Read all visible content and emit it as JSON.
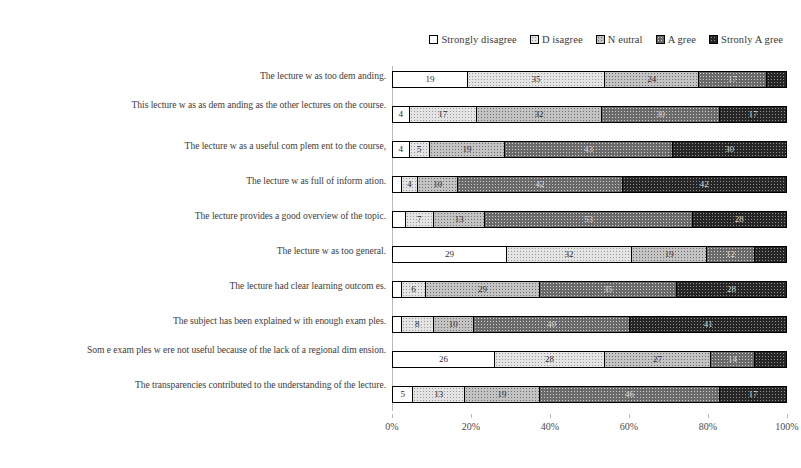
{
  "chart_data": {
    "type": "bar",
    "orientation": "horizontal",
    "stacked": true,
    "normalized_percent": true,
    "title": "",
    "xlabel": "",
    "ylabel": "",
    "xlim": [
      0,
      100
    ],
    "grid": false,
    "legend_position": "top-right",
    "axis_tick_labels": [
      "0%",
      "20%",
      "40%",
      "60%",
      "80%",
      "100%"
    ],
    "axis_tick_values": [
      0,
      20,
      40,
      60,
      80,
      100
    ],
    "legend": [
      "Strongly disagree",
      "D isagree",
      "N eutral",
      "A gree",
      "Stronly A gree"
    ],
    "series": [
      {
        "name": "Strongly disagree",
        "values": [
          19,
          4,
          4,
          2,
          3,
          29,
          2,
          2,
          26,
          5
        ]
      },
      {
        "name": "D isagree",
        "values": [
          35,
          17,
          5,
          4,
          7,
          32,
          6,
          8,
          28,
          13
        ]
      },
      {
        "name": "N eutral",
        "values": [
          24,
          32,
          19,
          10,
          13,
          19,
          29,
          10,
          27,
          19
        ]
      },
      {
        "name": "A gree",
        "values": [
          17,
          30,
          43,
          42,
          53,
          12,
          35,
          40,
          11,
          46
        ]
      },
      {
        "name": "Stronly A gree",
        "values": [
          5,
          17,
          29,
          42,
          24,
          8,
          28,
          40,
          8,
          17
        ]
      }
    ],
    "categories": [
      "The lecture w as too dem anding.",
      "This lecture w as as dem anding as the other lectures on the course.",
      "The lecture w as a useful com plem ent to the course,",
      "The lecture w as full of inform ation.",
      "The lecture provides a good overview  of the topic.",
      "The lecture w as too general.",
      "The lecture had clear learning outcom es.",
      "The subject has been explained w ith enough exam ples.",
      "Som e exam ples w ere not useful because of the lack of a regional dim ension.",
      "The transparencies contributed to the understanding of the lecture."
    ],
    "visible_labels": [
      [
        "19",
        "35",
        "24",
        "17",
        ""
      ],
      [
        "4",
        "17",
        "32",
        "30",
        "17"
      ],
      [
        "4",
        "5",
        "19",
        "43",
        "30"
      ],
      [
        "",
        "4",
        "10",
        "42",
        "42"
      ],
      [
        "",
        "7",
        "13",
        "53",
        "28"
      ],
      [
        "29",
        "32",
        "19",
        "12",
        ""
      ],
      [
        "",
        "6",
        "29",
        "35",
        "28"
      ],
      [
        "",
        "8",
        "10",
        "40",
        "41"
      ],
      [
        "26",
        "28",
        "27",
        "14",
        ""
      ],
      [
        "5",
        "13",
        "19",
        "46",
        "17"
      ]
    ]
  },
  "colors": {
    "strongly_disagree": "#ffffff",
    "disagree": "#e4e4e4",
    "neutral": "#c3c3c3",
    "agree": "#6a6a6a",
    "strongly_agree": "#262626",
    "axis": "#b9b9b9",
    "text": "#3d3d3d"
  }
}
